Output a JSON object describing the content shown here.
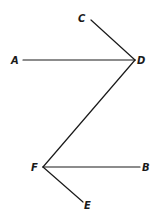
{
  "diagram": {
    "type": "geometry-line-segments",
    "points": {
      "A": {
        "label": "A",
        "x": 23,
        "y": 60,
        "label_x": 15,
        "label_y": 64
      },
      "C": {
        "label": "C",
        "x": 91,
        "y": 20,
        "label_x": 82,
        "label_y": 21
      },
      "D": {
        "label": "D",
        "x": 135,
        "y": 60,
        "label_x": 137,
        "label_y": 64
      },
      "F": {
        "label": "F",
        "x": 43,
        "y": 167,
        "label_x": 32,
        "label_y": 171
      },
      "B": {
        "label": "B",
        "x": 140,
        "y": 167,
        "label_x": 143,
        "label_y": 171
      },
      "E": {
        "label": "E",
        "x": 83,
        "y": 202,
        "label_x": 85,
        "label_y": 209
      }
    },
    "segments": [
      {
        "from": "A",
        "to": "D"
      },
      {
        "from": "C",
        "to": "D"
      },
      {
        "from": "D",
        "to": "F"
      },
      {
        "from": "F",
        "to": "B"
      },
      {
        "from": "F",
        "to": "E"
      }
    ],
    "labels": {
      "A": "A",
      "B": "B",
      "C": "C",
      "D": "D",
      "E": "E",
      "F": "F"
    }
  }
}
